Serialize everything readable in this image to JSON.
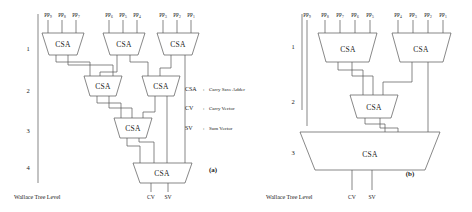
{
  "figure": {
    "caption_a": "(a)",
    "caption_b": "(b)",
    "wallace_tree_level_label": "Wallace Tree Level",
    "csa_label": "CSA",
    "output_cv": "CV",
    "output_sv": "SV",
    "pp_prefix": "PP"
  },
  "legend": {
    "items": [
      {
        "key": "CSA",
        "sep": ":",
        "value": "Carry Save Adder"
      },
      {
        "key": "CV",
        "sep": ":",
        "value": "Carry Vector"
      },
      {
        "key": "SV",
        "sep": ":",
        "value": "Sum Vector"
      }
    ]
  },
  "diagram_a": {
    "caption": "(a)",
    "levels": [
      "1",
      "2",
      "3",
      "4"
    ],
    "input_groups": [
      {
        "labels": [
          "PP",
          "PP",
          "PP"
        ],
        "subs": [
          "9",
          "8",
          "7"
        ]
      },
      {
        "labels": [
          "PP",
          "PP",
          "PP"
        ],
        "subs": [
          "6",
          "5",
          "4"
        ]
      },
      {
        "labels": [
          "PP",
          "PP",
          "PP"
        ],
        "subs": [
          "3",
          "2",
          "1"
        ]
      }
    ],
    "csa_counts_per_level": [
      3,
      2,
      1,
      1
    ],
    "outputs": [
      "CV",
      "SV"
    ]
  },
  "diagram_b": {
    "caption": "(b)",
    "levels": [
      "1",
      "2",
      "3"
    ],
    "standalone_input": {
      "label": "PP",
      "sub": "9"
    },
    "input_groups": [
      {
        "labels": [
          "PP",
          "PP",
          "PP",
          "PP"
        ],
        "subs": [
          "8",
          "7",
          "6",
          "5"
        ]
      },
      {
        "labels": [
          "PP",
          "PP",
          "PP",
          "PP"
        ],
        "subs": [
          "4",
          "3",
          "2",
          "1"
        ]
      }
    ],
    "csa_counts_per_level": [
      2,
      1,
      1
    ],
    "outputs": [
      "CV",
      "SV"
    ]
  },
  "colors": {
    "stroke": "#555555",
    "text": "#1a1a1a",
    "background": "#ffffff"
  }
}
